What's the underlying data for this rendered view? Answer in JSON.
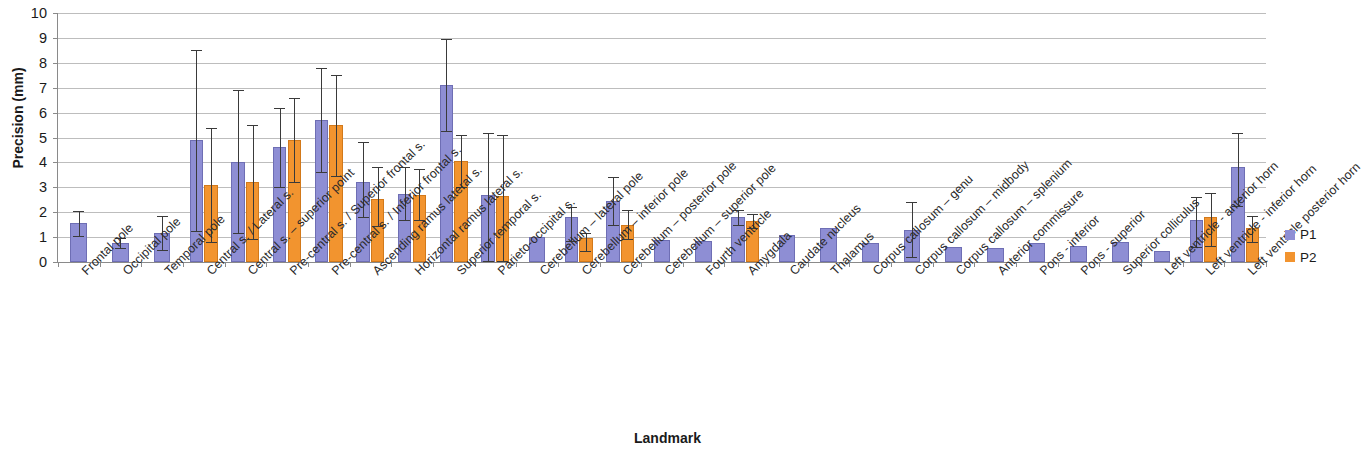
{
  "chart_data": {
    "type": "bar",
    "title": "",
    "subtitle": "",
    "xlabel": "Landmark",
    "ylabel": "Precision (mm)",
    "ylim": [
      0,
      10
    ],
    "ytick_labels": [
      "0",
      "1",
      "2",
      "3",
      "4",
      "5",
      "6",
      "7",
      "8",
      "9",
      "10"
    ],
    "ytick_values": [
      0,
      1,
      2,
      3,
      4,
      5,
      6,
      7,
      8,
      9,
      10
    ],
    "grid": true,
    "legend_position": "right",
    "error_bars": "range (min-max whiskers)",
    "categories": [
      "Frontal pole",
      "Occipital pole",
      "Temporal pole",
      "Central s. / Lateral s.",
      "Central s. – superior point",
      "Pre-central s. / Superior frontal s.",
      "Pre-central s. / Inferior frontal s.",
      "Ascending ramus lateral s.",
      "Horizontal ramus lateral s.",
      "Superior temporal s.",
      "Parieto-occipital s.",
      "Cerebellum – lateral pole",
      "Cerebellum – inferior pole",
      "Cerebellum – posterior pole",
      "Cerebellum – superior pole",
      "Fourth ventricle",
      "Amygdala",
      "Caudate nucleus",
      "Thalamus",
      "Corpus callosum – genu",
      "Corpus callosum – midbody",
      "Corpus callosum – splenium",
      "Anterior commissure",
      "Pons - inferior",
      "Pons - superior",
      "Superior colliculus",
      "Left ventricle - anterior horn",
      "Left ventricle - inferior horn",
      "Left ventricle posterior horn"
    ],
    "series": [
      {
        "name": "P1",
        "color": "#8e8ed4",
        "values": [
          1.55,
          0.75,
          1.15,
          4.9,
          4.0,
          4.6,
          5.7,
          3.2,
          2.75,
          7.1,
          2.7,
          1.0,
          1.8,
          2.45,
          0.9,
          0.85,
          1.8,
          1.1,
          1.35,
          0.75,
          1.3,
          0.6,
          0.55,
          0.75,
          0.65,
          0.8,
          0.45,
          1.7,
          3.8
        ],
        "err_low": [
          1.05,
          0.55,
          0.5,
          1.25,
          1.15,
          3.0,
          3.6,
          1.8,
          1.7,
          5.25,
          0.05,
          null,
          0.85,
          1.5,
          null,
          null,
          1.5,
          null,
          null,
          null,
          0.2,
          null,
          null,
          null,
          null,
          null,
          null,
          0.6,
          2.25
        ],
        "err_high": [
          2.05,
          0.95,
          1.85,
          8.5,
          6.9,
          6.2,
          7.8,
          4.8,
          3.8,
          8.95,
          5.2,
          null,
          2.2,
          3.4,
          null,
          null,
          2.1,
          null,
          null,
          null,
          2.4,
          null,
          null,
          null,
          null,
          null,
          null,
          2.6,
          5.2
        ]
      },
      {
        "name": "P2",
        "color": "#f2942f",
        "values": [
          null,
          null,
          null,
          3.1,
          3.2,
          4.9,
          5.5,
          2.55,
          2.7,
          4.05,
          2.65,
          null,
          0.95,
          1.5,
          null,
          null,
          1.65,
          null,
          null,
          null,
          null,
          null,
          null,
          null,
          null,
          null,
          null,
          1.8,
          1.35
        ]
      }
    ]
  },
  "legend": {
    "items": [
      {
        "label": "P1",
        "color": "#8e8ed4"
      },
      {
        "label": "P2",
        "color": "#f2942f"
      }
    ]
  }
}
